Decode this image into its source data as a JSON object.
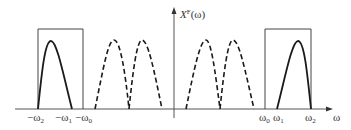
{
  "diagram": {
    "y_axis_label": {
      "base": "X",
      "sup": "F",
      "arg": "(ω)"
    },
    "x_axis_label": "ω",
    "tick_labels": {
      "neg_w2": {
        "sign": "−",
        "base": "ω",
        "sub": "2"
      },
      "neg_w1": {
        "sign": "−",
        "base": "ω",
        "sub": "1"
      },
      "neg_w0": {
        "sign": "−",
        "base": "ω",
        "sub": "0"
      },
      "w0": {
        "sign": "",
        "base": "ω",
        "sub": "0"
      },
      "w1": {
        "sign": "",
        "base": "ω",
        "sub": "1"
      },
      "w2": {
        "sign": "",
        "base": "ω",
        "sub": "2"
      }
    },
    "elements": [
      {
        "name": "left-filter-box",
        "style": "solid rectangle",
        "from": "-ω2",
        "to": "-ω0"
      },
      {
        "name": "left-solid-lobe",
        "style": "solid curve",
        "from": "-ω2",
        "to": "-ω1"
      },
      {
        "name": "left-dashed-lobes",
        "style": "dashed curves",
        "count": 2
      },
      {
        "name": "right-dashed-lobes",
        "style": "dashed curves",
        "count": 2
      },
      {
        "name": "right-filter-box",
        "style": "solid rectangle",
        "from": "ω0",
        "to": "ω2"
      },
      {
        "name": "right-solid-lobe",
        "style": "solid curve",
        "from": "ω1",
        "to": "ω2"
      }
    ],
    "colors": {
      "stroke": "#1a1a1a",
      "axis": "#555555",
      "text": "#333333"
    }
  }
}
